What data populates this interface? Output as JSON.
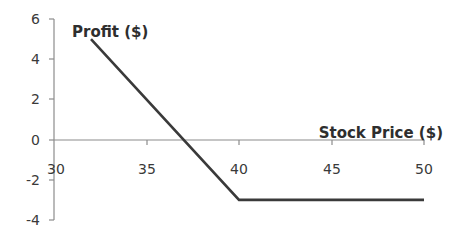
{
  "chart_data": {
    "type": "line",
    "title": "",
    "xlabel": "Stock Price ($)",
    "ylabel": "Profit ($)",
    "xlim": [
      30,
      50
    ],
    "ylim": [
      -4,
      6
    ],
    "x_ticks": [
      30,
      35,
      40,
      45,
      50
    ],
    "y_ticks": [
      6,
      4,
      2,
      0,
      -2,
      -4
    ],
    "grid": false,
    "legend": null,
    "series": [
      {
        "name": "Profit",
        "color": "#3a3a3a",
        "x": [
          32,
          40,
          50
        ],
        "y": [
          5,
          -3,
          -3
        ]
      }
    ]
  },
  "labels": {
    "ylabel": "Profit ($)",
    "xlabel": "Stock Price ($)",
    "x_ticks": [
      "30",
      "35",
      "40",
      "45",
      "50"
    ],
    "y_ticks": [
      "6",
      "4",
      "2",
      "0",
      "-2",
      "-4"
    ]
  },
  "colors": {
    "line": "#3a3a3a",
    "axis": "#8c8c8c",
    "text": "#3a3a3a"
  }
}
